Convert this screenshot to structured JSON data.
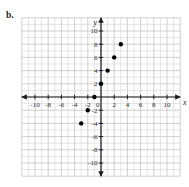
{
  "exercise_label": "b.",
  "title_partial": "Linear? (4, 14)",
  "chart_data": {
    "type": "scatter",
    "title": "",
    "xlabel": "x",
    "ylabel": "y",
    "xlim": [
      -12,
      12
    ],
    "ylim": [
      -12,
      12
    ],
    "grid": true,
    "grid_step": 1,
    "tick_step": 2,
    "x_tick_labels": [
      -10,
      -8,
      -6,
      -4,
      -2,
      2,
      4,
      6,
      8,
      10
    ],
    "y_tick_labels": [
      -10,
      -8,
      -6,
      -4,
      -2,
      2,
      4,
      6,
      8,
      10
    ],
    "origin_label": "0",
    "points": [
      [
        -3,
        -4
      ],
      [
        -2,
        -2
      ],
      [
        -1,
        0
      ],
      [
        0,
        2
      ],
      [
        1,
        4
      ],
      [
        2,
        6
      ],
      [
        3,
        8
      ]
    ],
    "colors": {
      "point": "#000000",
      "axis": "#1a1a1a",
      "grid_minor": "#d9d9d9",
      "grid_major": "#bcbcbc",
      "tick_label": "#2b2b2b"
    }
  }
}
